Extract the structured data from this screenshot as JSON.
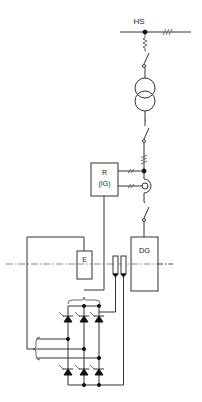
{
  "diagram": {
    "type": "electrical single-line diagram",
    "labels": {
      "busbar": "HS",
      "regulator_line1": "R",
      "regulator_line2": "(IG)",
      "exciter": "E",
      "generator": "DG"
    },
    "components": [
      {
        "id": "hs-busbar",
        "label": "HS",
        "kind": "high-voltage busbar (3-phase)"
      },
      {
        "id": "disconnector-top",
        "kind": "disconnector switch with fuse"
      },
      {
        "id": "transformer",
        "kind": "two-winding transformer"
      },
      {
        "id": "breaker-middle",
        "kind": "circuit breaker"
      },
      {
        "id": "regulator",
        "label": "R (IG)",
        "kind": "regulator box"
      },
      {
        "id": "current-transformer",
        "kind": "current transformer"
      },
      {
        "id": "breaker-generator",
        "kind": "generator breaker"
      },
      {
        "id": "generator",
        "label": "DG",
        "kind": "generator"
      },
      {
        "id": "exciter",
        "label": "E",
        "kind": "exciter"
      },
      {
        "id": "slip-rings",
        "kind": "slip rings (2)"
      },
      {
        "id": "thyristor-bridge",
        "kind": "3-phase thyristor bridge (6 thyristors)"
      }
    ],
    "colors": {
      "line": "#333333",
      "background": "#ffffff"
    }
  }
}
